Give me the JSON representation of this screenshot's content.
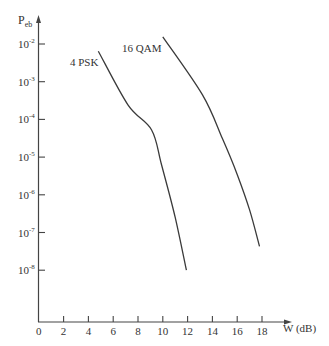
{
  "chart_data": {
    "type": "line",
    "title": "",
    "xlabel": "W (dB)",
    "ylabel": "P",
    "ylabel_sub": "eb",
    "xscale": "linear",
    "yscale": "log",
    "xlim": [
      0,
      20.5
    ],
    "ylim": [
      1e-09,
      0.05
    ],
    "grid": false,
    "legend": "inline labels",
    "x_ticks": [
      0,
      2,
      4,
      6,
      8,
      10,
      12,
      14,
      16,
      18
    ],
    "y_ticks": [
      {
        "exp": -2,
        "base": "10"
      },
      {
        "exp": -3,
        "base": "10"
      },
      {
        "exp": -4,
        "base": "10"
      },
      {
        "exp": -5,
        "base": "10"
      },
      {
        "exp": -6,
        "base": "10"
      },
      {
        "exp": -7,
        "base": "10"
      },
      {
        "exp": -8,
        "base": "10"
      }
    ],
    "series": [
      {
        "name": "4 PSK",
        "x": [
          4.8,
          7.2,
          9.1,
          9.9,
          11.0,
          11.9
        ],
        "log10_y": [
          -2.19,
          -3.62,
          -4.28,
          -5.21,
          -6.6,
          -8.0
        ]
      },
      {
        "name": "16 QAM",
        "x": [
          10.0,
          13.2,
          14.8,
          16.0,
          17.0,
          17.8
        ],
        "log10_y": [
          -1.81,
          -3.35,
          -4.5,
          -5.46,
          -6.4,
          -7.37
        ]
      }
    ]
  },
  "labels": {
    "y_axis_main": "P",
    "y_axis_sub": "eb",
    "x_axis": "W (dB)",
    "series_0": "4 PSK",
    "series_1": "16 QAM"
  }
}
